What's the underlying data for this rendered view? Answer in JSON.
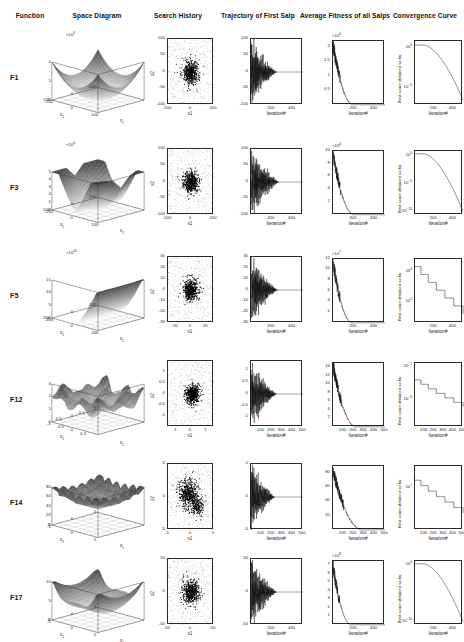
{
  "figure": {
    "columns": [
      {
        "id": "function",
        "label": "Function"
      },
      {
        "id": "space-diagram",
        "label": "Space Diagram"
      },
      {
        "id": "search-history",
        "label": "Search History"
      },
      {
        "id": "trajectory",
        "label": "Trajectory  of First Salp"
      },
      {
        "id": "average-fitness",
        "label": "Average Fitness of all Salps"
      },
      {
        "id": "convergence",
        "label": "Convergence Curve"
      }
    ],
    "axis_titles": {
      "iteration": "Iteration#",
      "x1": "x1",
      "x2": "x2",
      "best_score": "Best score obtained so far",
      "x1_3d": "x_1",
      "x2_3d": "x_2"
    }
  },
  "chart_data": [
    {
      "id": "F1",
      "function_label": "F1",
      "space_diagram": {
        "type": "surface",
        "shape": "convex-bowl",
        "xlim": [
          -100,
          100
        ],
        "ylim": [
          -100,
          100
        ],
        "zlim": [
          0,
          2
        ],
        "z_exponent": "10^4",
        "exponent_label": "×10",
        "xticks": [
          -100,
          0,
          100
        ],
        "yticks": [
          -100,
          0,
          100
        ],
        "zticks": [
          0,
          1,
          2
        ],
        "xlabel": "x_1",
        "ylabel": "x_2"
      },
      "search_history": {
        "type": "scatter",
        "xlim": [
          -100,
          100
        ],
        "ylim": [
          -100,
          100
        ],
        "xticks": [
          -100,
          0,
          100
        ],
        "yticks": [
          -100,
          -50,
          0,
          50,
          100
        ],
        "xlabel": "x1",
        "ylabel": "x2",
        "cluster_center": [
          0,
          0
        ],
        "cluster_spread": 18,
        "n_points": 900
      },
      "trajectory": {
        "type": "line",
        "xlim": [
          0,
          500
        ],
        "ylim": [
          -100,
          100
        ],
        "xticks": [
          200,
          400
        ],
        "yticks": [
          -100,
          -50,
          0,
          50,
          100
        ],
        "xlabel": "Iteration#",
        "decay_iteration": 250,
        "amplitude": 100
      },
      "average_fitness": {
        "type": "line",
        "xlim": [
          0,
          500
        ],
        "ylim": [
          0,
          2.2
        ],
        "xticks": [
          200,
          400
        ],
        "yticks": [
          0.5,
          1,
          1.5,
          2
        ],
        "y_exponent": "10^4",
        "xlabel": "Iteration#",
        "start": 2.1,
        "settle_iteration": 200
      },
      "convergence": {
        "type": "line",
        "scale": "log",
        "xlim": [
          0,
          500
        ],
        "xticks": [
          200,
          400
        ],
        "yticks": [
          "10^0",
          "10^-5"
        ],
        "xlabel": "Iteration#",
        "ylabel": "Best score obtained so far",
        "start_exp": 0.3,
        "end_exp": -6.5
      }
    },
    {
      "id": "F3",
      "function_label": "F3",
      "space_diagram": {
        "type": "surface",
        "shape": "steep-valley",
        "xlim": [
          -100,
          100
        ],
        "ylim": [
          -100,
          100
        ],
        "zlim": [
          0,
          5
        ],
        "z_exponent": "10^4",
        "xticks": [
          -100,
          0,
          100
        ],
        "yticks": [
          -100,
          0,
          100
        ],
        "zticks": [
          0,
          1,
          2,
          3,
          4,
          5
        ],
        "xlabel": "x_1",
        "ylabel": "x_2"
      },
      "search_history": {
        "type": "scatter",
        "xlim": [
          -100,
          100
        ],
        "ylim": [
          -100,
          100
        ],
        "xticks": [
          -100,
          0,
          100
        ],
        "yticks": [
          -100,
          -50,
          0,
          50,
          100
        ],
        "xlabel": "x1",
        "ylabel": "x2",
        "cluster_center": [
          0,
          0
        ],
        "cluster_spread": 16,
        "n_points": 900
      },
      "trajectory": {
        "type": "line",
        "xlim": [
          0,
          500
        ],
        "ylim": [
          -100,
          100
        ],
        "xticks": [
          200,
          400
        ],
        "yticks": [
          -100,
          -50,
          0,
          50,
          100
        ],
        "xlabel": "Iteration#",
        "decay_iteration": 270,
        "amplitude": 100
      },
      "average_fitness": {
        "type": "line",
        "xlim": [
          0,
          500
        ],
        "ylim": [
          0,
          10
        ],
        "xticks": [
          200,
          400
        ],
        "yticks": [
          2,
          4,
          6,
          8,
          10
        ],
        "y_exponent": "10^4",
        "xlabel": "Iteration#",
        "start": 9.5,
        "settle_iteration": 210
      },
      "convergence": {
        "type": "line",
        "scale": "log",
        "xlim": [
          0,
          500
        ],
        "xticks": [
          200,
          400
        ],
        "yticks": [
          "10^0",
          "10^-5",
          "10^-10"
        ],
        "xlabel": "Iteration#",
        "ylabel": "Best score obtained so far",
        "start_exp": 0.4,
        "end_exp": -10
      }
    },
    {
      "id": "F5",
      "function_label": "F5",
      "space_diagram": {
        "type": "surface",
        "shape": "rosenbrock-wall",
        "xlim": [
          -200,
          200
        ],
        "ylim": [
          -200,
          200
        ],
        "zlim": [
          0,
          15
        ],
        "z_exponent": "10^10",
        "xticks": [
          -200,
          0,
          200
        ],
        "yticks": [
          -200,
          0,
          200
        ],
        "zticks": [
          0,
          5,
          10,
          15
        ],
        "xlabel": "x_1",
        "ylabel": "x_2"
      },
      "search_history": {
        "type": "scatter",
        "xlim": [
          -30,
          30
        ],
        "ylim": [
          -30,
          30
        ],
        "xticks": [
          -20,
          0,
          20
        ],
        "yticks": [
          -30,
          -20,
          -10,
          0,
          10,
          20,
          30
        ],
        "xlabel": "x1",
        "ylabel": "x2",
        "cluster_center": [
          0,
          0
        ],
        "cluster_spread": 5,
        "n_points": 900
      },
      "trajectory": {
        "type": "line",
        "xlim": [
          0,
          500
        ],
        "ylim": [
          -30,
          30
        ],
        "xticks": [
          200,
          400
        ],
        "yticks": [
          -30,
          -20,
          -10,
          0,
          10,
          20,
          30
        ],
        "xlabel": "Iteration#",
        "decay_iteration": 260,
        "amplitude": 30
      },
      "average_fitness": {
        "type": "line",
        "xlim": [
          0,
          500
        ],
        "ylim": [
          0,
          12
        ],
        "xticks": [
          200,
          400
        ],
        "yticks": [
          2,
          4,
          6,
          8,
          10,
          12
        ],
        "y_exponent": "10^7",
        "xlabel": "Iteration#",
        "start": 11.5,
        "settle_iteration": 190
      },
      "convergence": {
        "type": "line",
        "scale": "log",
        "xlim": [
          0,
          500
        ],
        "xticks": [
          200,
          400
        ],
        "yticks": [
          "10^4",
          "10^2"
        ],
        "xlabel": "Iteration#",
        "ylabel": "Best score obtained so far",
        "start_exp": 4.3,
        "end_exp": 1.2,
        "stepped": true
      }
    },
    {
      "id": "F12",
      "function_label": "F12",
      "space_diagram": {
        "type": "surface",
        "shape": "rugged-multimodal",
        "xlim": [
          -1,
          1
        ],
        "ylim": [
          -1,
          1
        ],
        "zlim": [
          0,
          3
        ],
        "z_exponent": "",
        "xticks": [
          -1,
          -0.5,
          0,
          0.5
        ],
        "yticks": [
          -1,
          -0.5,
          0,
          0.5
        ],
        "zticks": [
          0,
          1,
          2,
          3
        ],
        "xlabel": "x_1",
        "ylabel": "x_2"
      },
      "search_history": {
        "type": "scatter",
        "xlim": [
          -1.5,
          1.5
        ],
        "ylim": [
          -1.5,
          1.5
        ],
        "xticks": [
          -1,
          0,
          1
        ],
        "yticks": [
          -1,
          -0.5,
          0,
          0.5,
          1
        ],
        "xlabel": "x1",
        "ylabel": "x2",
        "cluster_center": [
          0.1,
          0
        ],
        "cluster_spread": 0.22,
        "n_points": 900
      },
      "trajectory": {
        "type": "line",
        "xlim": [
          0,
          500
        ],
        "ylim": [
          -1.4,
          1.4
        ],
        "xticks": [
          100,
          200,
          300,
          400,
          500
        ],
        "yticks": [
          -1,
          -0.5,
          0,
          0.5,
          1
        ],
        "xlabel": "Iteration#",
        "decay_iteration": 250,
        "amplitude": 1.3
      },
      "average_fitness": {
        "type": "line",
        "xlim": [
          0,
          500
        ],
        "ylim": [
          0,
          15
        ],
        "xticks": [
          100,
          200,
          300,
          400,
          500
        ],
        "yticks": [
          2,
          4,
          6,
          8,
          10,
          12,
          14
        ],
        "y_exponent": "",
        "xlabel": "Iteration#",
        "start": 14.5,
        "settle_iteration": 230
      },
      "convergence": {
        "type": "line",
        "scale": "log",
        "xlim": [
          0,
          500
        ],
        "xticks": [
          100,
          200,
          300,
          400,
          500
        ],
        "yticks": [
          "10^-1",
          "10^-2",
          "10^-3"
        ],
        "xlabel": "Iteration#",
        "ylabel": "Best score obtained so far",
        "start_exp": -2.4,
        "end_exp": -3.2,
        "stepped": true
      }
    },
    {
      "id": "F14",
      "function_label": "F14",
      "space_diagram": {
        "type": "surface",
        "shape": "foxholes-spiky",
        "xlim": [
          -5,
          5
        ],
        "ylim": [
          -5,
          5
        ],
        "zlim": [
          0,
          80
        ],
        "z_exponent": "",
        "xticks": [
          -5,
          0,
          5
        ],
        "yticks": [
          -5,
          0,
          5
        ],
        "zticks": [
          0,
          20,
          40,
          60,
          80
        ],
        "xlabel": "x_1",
        "ylabel": "x_2"
      },
      "search_history": {
        "type": "scatter",
        "xlim": [
          -5,
          5
        ],
        "ylim": [
          -5,
          5
        ],
        "xticks": [
          -5,
          0,
          5
        ],
        "yticks": [
          -5,
          0,
          5
        ],
        "xlabel": "x1",
        "ylabel": "x2",
        "cluster_center": [
          -0.6,
          0.5
        ],
        "cluster_spread": 1.1,
        "n_points": 900
      },
      "trajectory": {
        "type": "line",
        "xlim": [
          0,
          500
        ],
        "ylim": [
          -5,
          5
        ],
        "xticks": [
          100,
          200,
          300,
          400,
          500
        ],
        "yticks": [
          -5,
          0,
          5
        ],
        "xlabel": "Iteration#",
        "decay_iteration": 230,
        "amplitude": 5
      },
      "average_fitness": {
        "type": "line",
        "xlim": [
          0,
          500
        ],
        "ylim": [
          0,
          90
        ],
        "xticks": [
          100,
          200,
          300,
          400,
          500
        ],
        "yticks": [
          20,
          40,
          60,
          80
        ],
        "y_exponent": "",
        "xlabel": "Iteration#",
        "start": 85,
        "settle_iteration": 290
      },
      "convergence": {
        "type": "line",
        "scale": "log",
        "xlim": [
          0,
          500
        ],
        "xticks": [
          100,
          200,
          300,
          400,
          500
        ],
        "yticks": [
          "10^1"
        ],
        "xlabel": "Iteration#",
        "ylabel": "Best score obtained so far",
        "start_exp": 1.25,
        "end_exp": 0.1,
        "stepped": true
      }
    },
    {
      "id": "F17",
      "function_label": "F17",
      "space_diagram": {
        "type": "surface",
        "shape": "branin-curved",
        "xlim": [
          -5,
          5
        ],
        "ylim": [
          -5,
          5
        ],
        "zlim": [
          0,
          10
        ],
        "z_exponent": "",
        "xticks": [
          -5,
          0,
          5
        ],
        "yticks": [
          -5,
          0,
          5
        ],
        "zticks": [
          0,
          5,
          10
        ],
        "xlabel": "x_1",
        "ylabel": "x_2"
      },
      "search_history": {
        "type": "scatter",
        "xlim": [
          -50,
          50
        ],
        "ylim": [
          -50,
          50
        ],
        "xticks": [
          -50,
          0,
          50
        ],
        "yticks": [
          -50,
          0,
          50
        ],
        "xlabel": "x1",
        "ylabel": "x2",
        "cluster_center": [
          0,
          0
        ],
        "cluster_spread": 9,
        "n_points": 900
      },
      "trajectory": {
        "type": "line",
        "xlim": [
          0,
          500
        ],
        "ylim": [
          -50,
          50
        ],
        "xticks": [
          200,
          400
        ],
        "yticks": [
          -50,
          0,
          50
        ],
        "xlabel": "Iteration#",
        "decay_iteration": 250,
        "amplitude": 50
      },
      "average_fitness": {
        "type": "line",
        "xlim": [
          0,
          500
        ],
        "ylim": [
          0,
          7.5
        ],
        "xticks": [
          200,
          400
        ],
        "yticks": [
          1,
          2,
          3,
          4,
          5,
          6,
          7
        ],
        "y_exponent": "10^8",
        "xlabel": "Iteration#",
        "start": 7,
        "settle_iteration": 180
      },
      "convergence": {
        "type": "line",
        "scale": "log",
        "xlim": [
          0,
          500
        ],
        "xticks": [
          200,
          400
        ],
        "yticks": [
          "10^0",
          "10^-10"
        ],
        "xlabel": "Iteration#",
        "ylabel": "Best score obtained so far",
        "start_exp": 0.2,
        "end_exp": -10
      }
    }
  ]
}
